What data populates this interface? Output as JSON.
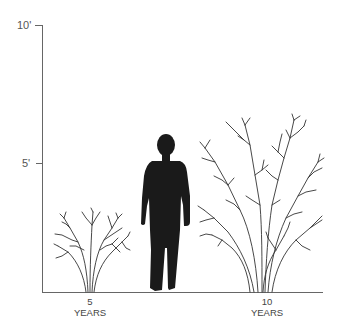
{
  "diagram": {
    "title": "",
    "y_axis": {
      "ticks": [
        {
          "label": "10'",
          "value_ft": 10
        },
        {
          "label": "5'",
          "value_ft": 5
        }
      ]
    },
    "x_labels": [
      {
        "number": "5",
        "unit": "YEARS"
      },
      {
        "number": "10",
        "unit": "YEARS"
      }
    ],
    "figures": [
      {
        "name": "shrub-at-5-years",
        "approx_height_ft": 2.8
      },
      {
        "name": "human-silhouette",
        "approx_height_ft": 5.7
      },
      {
        "name": "shrub-at-10-years",
        "approx_height_ft": 6.3
      }
    ],
    "colors": {
      "axis": "#666666",
      "branches": "#333333",
      "silhouette": "#1a1a1a"
    }
  }
}
